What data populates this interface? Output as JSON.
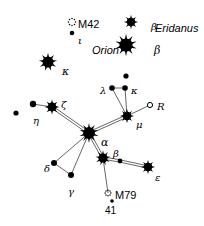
{
  "chart_data": {
    "type": "scatter",
    "title": "",
    "subtitle": "",
    "xlabel": "",
    "ylabel": "",
    "xlim": [
      0,
      204
    ],
    "ylim": [
      0,
      226
    ],
    "grid": false,
    "legend": "none",
    "constellation_labels": [
      {
        "text": "Orion",
        "x": 92,
        "y": 45,
        "style": "name",
        "size": 11
      },
      {
        "text": "Eridanus",
        "x": 155,
        "y": 23,
        "style": "name",
        "size": 11
      }
    ],
    "stars": [
      {
        "id": "beta-eridani",
        "label": "β",
        "label_x": 151,
        "label_y": 22,
        "x": 131,
        "y": 22,
        "r": 4.6,
        "kind": "spiked",
        "spikes": 8
      },
      {
        "id": "beta-orionis",
        "label": "β",
        "label_x": 154,
        "label_y": 45,
        "x": 126,
        "y": 45,
        "r": 7.2,
        "kind": "spiked",
        "spikes": 10
      },
      {
        "id": "kappa-orionis",
        "label": "κ",
        "label_x": 62,
        "label_y": 66,
        "x": 48,
        "y": 62,
        "r": 6.0,
        "kind": "spiked",
        "spikes": 9
      },
      {
        "id": "iota-orionis",
        "label": "ι",
        "label_x": 78,
        "label_y": 36,
        "x": 72,
        "y": 33,
        "r": 2.3,
        "kind": "dot"
      },
      {
        "id": "lepus-unnamed-top",
        "label": "",
        "label_x": 0,
        "label_y": 0,
        "x": 126,
        "y": 76,
        "r": 2.6,
        "kind": "dot"
      },
      {
        "id": "lambda-leporis",
        "label": "λ",
        "label_x": 100,
        "label_y": 86,
        "x": 112,
        "y": 88,
        "r": 2.8,
        "kind": "dot"
      },
      {
        "id": "kappa-leporis",
        "label": "κ",
        "label_x": 131,
        "label_y": 86,
        "x": 125,
        "y": 88,
        "r": 2.8,
        "kind": "dot"
      },
      {
        "id": "R-leporis",
        "label": "R",
        "label_x": 157,
        "label_y": 102,
        "x": 150,
        "y": 105,
        "r": 2.6,
        "kind": "open"
      },
      {
        "id": "mu-leporis",
        "label": "μ",
        "label_x": 136,
        "label_y": 120,
        "x": 127,
        "y": 116,
        "r": 4.6,
        "kind": "spiked",
        "spikes": 8
      },
      {
        "id": "zeta-leporis",
        "label": "ζ",
        "label_x": 61,
        "label_y": 100,
        "x": 52,
        "y": 107,
        "r": 4.8,
        "kind": "spiked",
        "spikes": 8
      },
      {
        "id": "eta-leporis",
        "label": "η",
        "label_x": 33,
        "label_y": 116,
        "x": 33,
        "y": 104,
        "r": 3.2,
        "kind": "dot"
      },
      {
        "id": "lepus-unnamed-left",
        "label": "",
        "label_x": 0,
        "label_y": 0,
        "x": 16,
        "y": 113,
        "r": 2.6,
        "kind": "dot"
      },
      {
        "id": "alpha-leporis",
        "label": "α",
        "label_x": 101,
        "label_y": 137,
        "x": 89,
        "y": 133,
        "r": 6.4,
        "kind": "spiked",
        "spikes": 10
      },
      {
        "id": "beta-leporis",
        "label": "β",
        "label_x": 113,
        "label_y": 149,
        "x": 103,
        "y": 158,
        "r": 5.0,
        "kind": "spiked",
        "spikes": 9
      },
      {
        "id": "lepus-unnamed-mid",
        "label": "",
        "label_x": 0,
        "label_y": 0,
        "x": 120,
        "y": 161,
        "r": 2.4,
        "kind": "dot"
      },
      {
        "id": "epsilon-leporis",
        "label": "ε",
        "label_x": 155,
        "label_y": 173,
        "x": 148,
        "y": 167,
        "r": 4.6,
        "kind": "spiked",
        "spikes": 8
      },
      {
        "id": "delta-leporis",
        "label": "δ",
        "label_x": 44,
        "label_y": 164,
        "x": 54,
        "y": 163,
        "r": 3.0,
        "kind": "dot"
      },
      {
        "id": "gamma-leporis",
        "label": "γ",
        "label_x": 68,
        "label_y": 187,
        "x": 71,
        "y": 175,
        "r": 3.0,
        "kind": "dot"
      },
      {
        "id": "star-41-leporis",
        "label": "",
        "label_x": 0,
        "label_y": 0,
        "x": 112,
        "y": 201,
        "r": 1.8,
        "kind": "dot"
      }
    ],
    "deep_sky_objects": [
      {
        "id": "M42",
        "label": "M42",
        "label_x": 78,
        "label_y": 19,
        "x": 72,
        "y": 22,
        "r": 4.2,
        "kind": "nebula"
      },
      {
        "id": "M79",
        "label": "M79",
        "label_x": 115,
        "label_y": 190,
        "x": 108,
        "y": 193,
        "r": 3.4,
        "kind": "cluster"
      }
    ],
    "object_ids": [
      {
        "text": "41",
        "x": 105,
        "y": 206,
        "style": "id",
        "size": 10
      }
    ],
    "lines": [
      {
        "from": "eta-leporis",
        "to": "zeta-leporis",
        "weight": "single"
      },
      {
        "from": "zeta-leporis",
        "to": "alpha-leporis",
        "weight": "double"
      },
      {
        "from": "lambda-leporis",
        "to": "kappa-leporis",
        "weight": "single"
      },
      {
        "from": "lambda-leporis",
        "to": "mu-leporis",
        "weight": "single"
      },
      {
        "from": "kappa-leporis",
        "to": "mu-leporis",
        "weight": "single"
      },
      {
        "from": "mu-leporis",
        "to": "R-leporis",
        "weight": "single"
      },
      {
        "from": "mu-leporis",
        "to": "alpha-leporis",
        "weight": "double"
      },
      {
        "from": "alpha-leporis",
        "to": "beta-leporis",
        "weight": "double"
      },
      {
        "from": "alpha-leporis",
        "to": "delta-leporis",
        "weight": "single"
      },
      {
        "from": "alpha-leporis",
        "to": "gamma-leporis",
        "weight": "single"
      },
      {
        "from": "delta-leporis",
        "to": "gamma-leporis",
        "weight": "single"
      },
      {
        "from": "beta-leporis",
        "to": "lepus-unnamed-mid",
        "weight": "double"
      },
      {
        "from": "lepus-unnamed-mid",
        "to": "epsilon-leporis",
        "weight": "double"
      },
      {
        "from": "beta-leporis",
        "to": "M79",
        "weight": "single"
      }
    ],
    "colors": {
      "background": "#ffffff",
      "ink": "#000000",
      "line": "#55565a"
    }
  }
}
